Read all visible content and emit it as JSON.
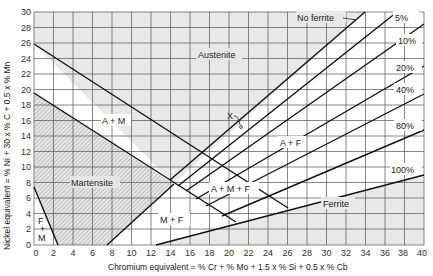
{
  "diagram": {
    "x_axis": {
      "label": "Chromium  equivalent = % Cr + % Mo + 1.5 x % Si + 0.5 x % Cb",
      "min": 0,
      "max": 40,
      "ticks": [
        "0",
        "2",
        "4",
        "6",
        "8",
        "10",
        "12",
        "14",
        "16",
        "18",
        "20",
        "22",
        "24",
        "26",
        "28",
        "30",
        "32",
        "34",
        "36",
        "38",
        "40"
      ]
    },
    "y_axis": {
      "label": "Nickel  equivalent = % Ni + 30 x % C + 0.5 x % Mn",
      "min": 0,
      "max": 30,
      "ticks": [
        "0",
        "2",
        "4",
        "6",
        "8",
        "10",
        "12",
        "14",
        "16",
        "18",
        "20",
        "22",
        "24",
        "26",
        "28",
        "30"
      ]
    },
    "regions": {
      "austenite": "Austenite",
      "a_m": "A + M",
      "martensite": "Martensite",
      "f_m_top": "F",
      "f_m_plus": "+",
      "f_m_bottom": "M",
      "m_f": "M + F",
      "a_m_f": "A + M + F",
      "a_f": "A + F",
      "ferrite": "Ferrite"
    },
    "annotations": {
      "no_ferrite": "No ferrite",
      "x_mark": "X"
    },
    "ferrite_lines": [
      "5%",
      "10%",
      "20%",
      "40%",
      "80%",
      "100%"
    ]
  }
}
